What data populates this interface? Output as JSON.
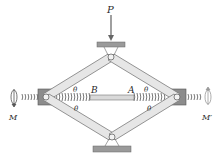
{
  "diagram": {
    "type": "scissor-jack",
    "labels": {
      "load": "P",
      "moment_left": "M",
      "moment_right": "M′",
      "point_b": "B",
      "point_a": "A",
      "angle": "θ"
    },
    "colors": {
      "link_fill": "#e6e6e6",
      "link_stroke": "#7a7a7a",
      "plate_fill": "#9a9a9a",
      "block_fill": "#8c8c8c",
      "spring_stroke": "#6a6a6a",
      "text": "#2a2a2a"
    }
  }
}
